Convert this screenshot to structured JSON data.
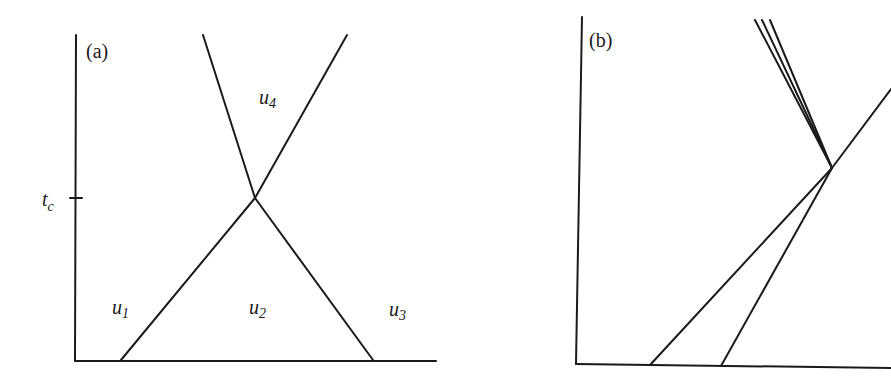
{
  "panels": [
    {
      "id": "a",
      "label": "(a)",
      "axis_tick_label": "t",
      "axis_tick_sub": "c",
      "regions": [
        {
          "name": "u",
          "sub": "1"
        },
        {
          "name": "u",
          "sub": "2"
        },
        {
          "name": "u",
          "sub": "3"
        },
        {
          "name": "u",
          "sub": "4"
        }
      ],
      "description": "Two characteristic lines crossing at time t_c"
    },
    {
      "id": "b",
      "label": "(b)",
      "description": "Two lines meeting, then one line continuing with a fan of three lines emanating upward-left"
    }
  ],
  "colors": {
    "stroke": "#1a1a1a",
    "background": "#ffffff"
  }
}
